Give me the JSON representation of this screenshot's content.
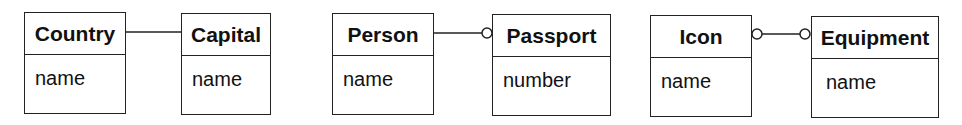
{
  "diagram": {
    "type": "uml-class-associations",
    "classes": [
      {
        "id": "country",
        "name": "Country",
        "attributes": [
          "name"
        ]
      },
      {
        "id": "capital",
        "name": "Capital",
        "attributes": [
          "name"
        ]
      },
      {
        "id": "person",
        "name": "Person",
        "attributes": [
          "name"
        ]
      },
      {
        "id": "passport",
        "name": "Passport",
        "attributes": [
          "number"
        ]
      },
      {
        "id": "icon",
        "name": "Icon",
        "attributes": [
          "name"
        ]
      },
      {
        "id": "equipment",
        "name": "Equipment",
        "attributes": [
          "name"
        ]
      }
    ],
    "associations": [
      {
        "from": "Country",
        "to": "Capital",
        "from_end": "exactly-one",
        "to_end": "exactly-one"
      },
      {
        "from": "Person",
        "to": "Passport",
        "from_end": "exactly-one",
        "to_end": "zero-or-one (circle)"
      },
      {
        "from": "Icon",
        "to": "Equipment",
        "from_end": "zero-or-one (circle)",
        "to_end": "zero-or-one (circle)"
      }
    ],
    "line_color": "#222222"
  }
}
